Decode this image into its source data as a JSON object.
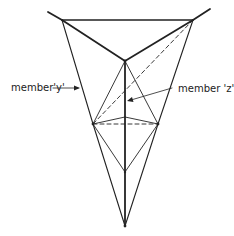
{
  "diagram": {
    "labels": {
      "member_y": "member'y'",
      "member_z": "member 'z'"
    },
    "colors": {
      "line": "#222222",
      "background": "#ffffff"
    }
  }
}
